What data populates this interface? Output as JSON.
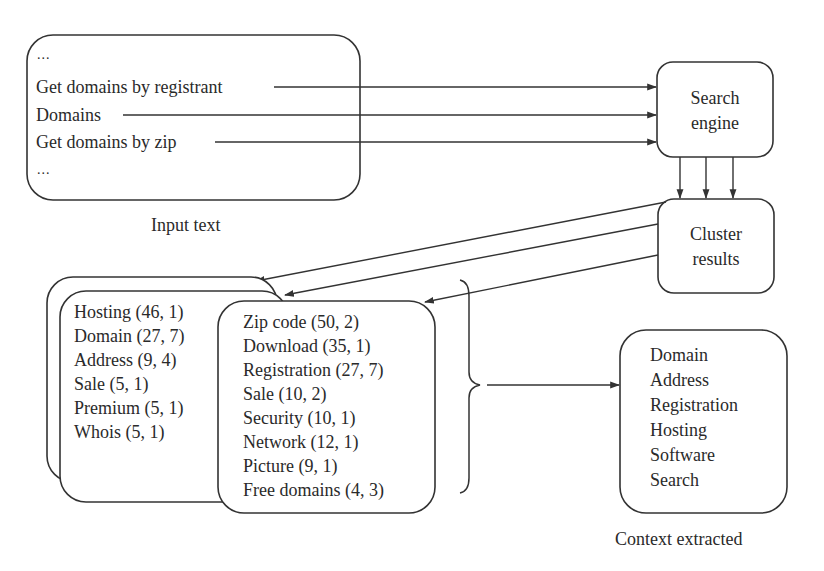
{
  "input_box": {
    "caption": "Input text",
    "lines": [
      "...",
      "Get domains by registrant",
      "Domains",
      "Get domains by zip",
      "..."
    ]
  },
  "search_engine": {
    "label_line1": "Search",
    "label_line2": "engine"
  },
  "cluster_results": {
    "label_line1": "Cluster",
    "label_line2": "results"
  },
  "cluster_card_1": {
    "items": [
      "Hosting (46, 1)",
      "Domain (27, 7)",
      "Address (9, 4)",
      "Sale (5, 1)",
      "Premium (5, 1)",
      "Whois (5, 1)"
    ]
  },
  "cluster_card_2": {
    "items": [
      "Zip code (50, 2)",
      "Download (35, 1)",
      "Registration (27, 7)",
      "Sale (10, 2)",
      "Security (10, 1)",
      "Network (12, 1)",
      "Picture (9, 1)",
      "Free domains (4, 3)"
    ]
  },
  "context_box": {
    "caption": "Context extracted",
    "items": [
      "Domain",
      "Address",
      "Registration",
      "Hosting",
      "Software",
      "Search"
    ]
  },
  "colors": {
    "stroke": "#333333",
    "text": "#2a2a2a",
    "background": "#ffffff"
  }
}
